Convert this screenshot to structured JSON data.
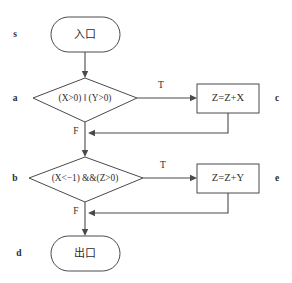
{
  "diagram": {
    "stroke_color": "#4a4a4a",
    "text_color": "#2d2d2d",
    "background_color": "#ffffff",
    "nodes": [
      {
        "id": "s",
        "shape": "rounded-rectangle",
        "label": "入口",
        "margin_label": "s"
      },
      {
        "id": "a",
        "shape": "diamond",
        "label": "(X>0) ‖ (Y>0)",
        "margin_label": "a"
      },
      {
        "id": "c",
        "shape": "rectangle",
        "label": "Z=Z+X",
        "margin_label": "c"
      },
      {
        "id": "b",
        "shape": "diamond",
        "label": "(X<−1) &&(Z>0)",
        "margin_label": "b"
      },
      {
        "id": "e",
        "shape": "rectangle",
        "label": "Z=Z+Y",
        "margin_label": "e"
      },
      {
        "id": "d",
        "shape": "rounded-rectangle",
        "label": "出口",
        "margin_label": "d"
      }
    ],
    "edge_labels": {
      "a_true": "T",
      "a_false": "F",
      "b_true": "T",
      "b_false": "F"
    }
  }
}
